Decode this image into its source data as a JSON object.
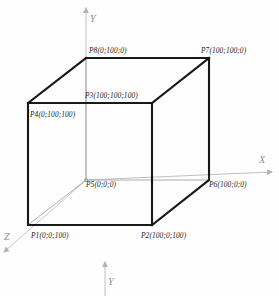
{
  "figure": {
    "colors": {
      "cube_edge": "#1a1a1a",
      "axis": "#b4b4b4",
      "hidden_edge": "#8a8a8a",
      "label_text": "#1a1a1a",
      "axis_label_text": "#8e8e8e",
      "background": "#fefefe"
    }
  },
  "axes": [
    {
      "id": "y-axis-top",
      "label": "Y",
      "direction": "up",
      "label_x": 90,
      "label_y": 14
    },
    {
      "id": "x-axis",
      "label": "X",
      "direction": "right",
      "label_x": 259,
      "label_y": 155
    },
    {
      "id": "z-axis",
      "label": "Z",
      "direction": "down-left",
      "label_x": 4,
      "label_y": 232
    },
    {
      "id": "y-axis-bottom",
      "label": "Y",
      "direction": "up",
      "label_x": 108,
      "label_y": 277
    }
  ],
  "vertices": [
    {
      "id": "P1",
      "name": "P1",
      "coords": "(0;0;100)",
      "label": "P1(0;0;100)",
      "px": 28,
      "py": 225,
      "label_x": 31,
      "label_y": 232
    },
    {
      "id": "P2",
      "name": "P2",
      "coords": "(100;0;100)",
      "label": "P2(100;0;100)",
      "px": 152,
      "py": 225,
      "label_x": 141,
      "label_y": 232
    },
    {
      "id": "P3",
      "name": "P3",
      "coords": "(100;100;100)",
      "label": "P3(100;100;100)",
      "px": 152,
      "py": 103,
      "label_x": 85,
      "label_y": 92
    },
    {
      "id": "P4",
      "name": "P4",
      "coords": "(0;100;100)",
      "label": "P4(0;100;100)",
      "px": 28,
      "py": 103,
      "label_x": 30,
      "label_y": 111
    },
    {
      "id": "P5",
      "name": "P5",
      "coords": "(0;0;0)",
      "label": "P5(0;0;0)",
      "px": 86,
      "py": 180,
      "label_x": 86,
      "label_y": 181
    },
    {
      "id": "P6",
      "name": "P6",
      "coords": "(100;0;0)",
      "label": "P6(100;0;0)",
      "px": 209,
      "py": 180,
      "label_x": 209,
      "label_y": 181
    },
    {
      "id": "P7",
      "name": "P7",
      "coords": "(100;100;0)",
      "label": "P7(100;100;0)",
      "px": 209,
      "py": 58,
      "label_x": 201,
      "label_y": 47
    },
    {
      "id": "P8",
      "name": "P8",
      "coords": "(0;100;0)",
      "label": "P8(0;100;0)",
      "px": 86,
      "py": 58,
      "label_x": 89,
      "label_y": 47
    }
  ],
  "edges": [
    {
      "id": "front-top",
      "from": "P4",
      "to": "P3",
      "style": "solid"
    },
    {
      "id": "front-right",
      "from": "P3",
      "to": "P2",
      "style": "solid"
    },
    {
      "id": "front-bottom",
      "from": "P1",
      "to": "P2",
      "style": "solid"
    },
    {
      "id": "front-left",
      "from": "P4",
      "to": "P1",
      "style": "solid"
    },
    {
      "id": "back-top",
      "from": "P8",
      "to": "P7",
      "style": "solid"
    },
    {
      "id": "back-right",
      "from": "P7",
      "to": "P6",
      "style": "solid"
    },
    {
      "id": "back-bottom",
      "from": "P5",
      "to": "P6",
      "style": "thin"
    },
    {
      "id": "back-left",
      "from": "P8",
      "to": "P5",
      "style": "thin"
    },
    {
      "id": "diag-top-left",
      "from": "P4",
      "to": "P8",
      "style": "solid"
    },
    {
      "id": "diag-top-right",
      "from": "P3",
      "to": "P7",
      "style": "solid"
    },
    {
      "id": "diag-bottom-left",
      "from": "P1",
      "to": "P5",
      "style": "thin"
    },
    {
      "id": "diag-bottom-right",
      "from": "P2",
      "to": "P6",
      "style": "solid"
    }
  ]
}
